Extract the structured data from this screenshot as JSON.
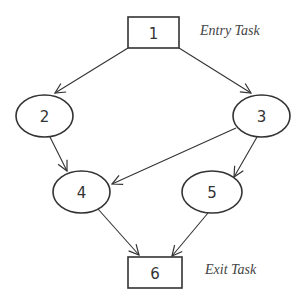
{
  "diagram": {
    "type": "task-dag",
    "nodes": [
      {
        "id": "1",
        "label": "1",
        "shape": "rect",
        "cx": 153.5,
        "cy": 32.5,
        "w": 51,
        "h": 31
      },
      {
        "id": "2",
        "label": "2",
        "shape": "ellipse",
        "cx": 44.5,
        "cy": 116,
        "rx": 28.5,
        "ry": 21
      },
      {
        "id": "3",
        "label": "3",
        "shape": "ellipse",
        "cx": 261.5,
        "cy": 116,
        "rx": 28.5,
        "ry": 21
      },
      {
        "id": "4",
        "label": "4",
        "shape": "ellipse",
        "cx": 81.5,
        "cy": 192,
        "rx": 28.5,
        "ry": 21
      },
      {
        "id": "5",
        "label": "5",
        "shape": "ellipse",
        "cx": 212,
        "cy": 192,
        "rx": 30,
        "ry": 21
      },
      {
        "id": "6",
        "label": "6",
        "shape": "rect",
        "cx": 155,
        "cy": 272.5,
        "w": 54,
        "h": 31
      }
    ],
    "edges": [
      {
        "from": "1",
        "to": "2",
        "x1": 128,
        "y1": 48,
        "x2": 55,
        "y2": 93
      },
      {
        "from": "1",
        "to": "3",
        "x1": 179,
        "y1": 48,
        "x2": 251,
        "y2": 93
      },
      {
        "from": "2",
        "to": "4",
        "x1": 50,
        "y1": 137,
        "x2": 67,
        "y2": 171
      },
      {
        "from": "3",
        "to": "4",
        "x1": 236,
        "y1": 128,
        "x2": 112,
        "y2": 184
      },
      {
        "from": "3",
        "to": "5",
        "x1": 257,
        "y1": 137,
        "x2": 234,
        "y2": 177
      },
      {
        "from": "4",
        "to": "6",
        "x1": 98,
        "y1": 209,
        "x2": 139,
        "y2": 255
      },
      {
        "from": "5",
        "to": "6",
        "x1": 208,
        "y1": 213,
        "x2": 172,
        "y2": 256
      }
    ],
    "annotations": [
      {
        "text": "Entry Task",
        "x": 200,
        "y": 35
      },
      {
        "text": "Exit Task",
        "x": 205,
        "y": 274
      }
    ],
    "colors": {
      "stroke": "#333333",
      "background": "#ffffff",
      "annotation": "#444444"
    }
  }
}
